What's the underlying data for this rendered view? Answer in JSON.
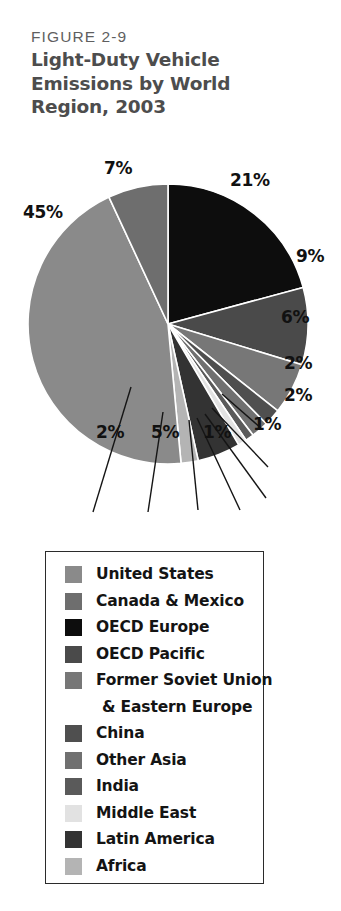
{
  "figure": {
    "number": "FIGURE 2-9",
    "title": "Light-Duty Vehicle Emissions by World Region, 2003"
  },
  "chart_data": {
    "type": "pie",
    "title": "Light-Duty Vehicle Emissions by World Region, 2003",
    "xlabel": "",
    "ylabel": "",
    "units": "percent of world light-duty vehicle emissions",
    "legend_position": "below",
    "grid": false,
    "categories": [
      "United States",
      "Canada & Mexico",
      "OECD Europe",
      "OECD Pacific",
      "Former Soviet Union & Eastern Europe",
      "China",
      "Other Asia",
      "India",
      "Middle East",
      "Latin America",
      "Africa"
    ],
    "values": [
      45,
      7,
      21,
      9,
      6,
      2,
      2,
      1,
      1,
      5,
      2
    ],
    "value_labels": [
      "45%",
      "7%",
      "21%",
      "9%",
      "6%",
      "2%",
      "2%",
      "1%",
      "1%",
      "5%",
      "2%"
    ],
    "colors": [
      "#8a8a8a",
      "#6e6e6e",
      "#0d0d0d",
      "#4a4a4a",
      "#777777",
      "#4f4f4f",
      "#707070",
      "#5a5a5a",
      "#e2e2e2",
      "#333333",
      "#b4b4b4"
    ],
    "slice_order_clockwise_from_12": [
      "OECD Europe",
      "OECD Pacific",
      "Former Soviet Union & Eastern Europe",
      "China",
      "Other Asia",
      "India",
      "Middle East",
      "Latin America",
      "Africa",
      "United States",
      "Canada & Mexico"
    ]
  },
  "labels": {
    "pct_21": "21%",
    "pct_9": "9%",
    "pct_6": "6%",
    "pct_2_china": "2%",
    "pct_2_otherasia": "2%",
    "pct_1_india": "1%",
    "pct_1_middleeast": "1%",
    "pct_5_latin": "5%",
    "pct_2_africa": "2%",
    "pct_45": "45%",
    "pct_7": "7%"
  },
  "legend": {
    "items": [
      {
        "label": "United States",
        "color": "#8a8a8a",
        "continuation": false
      },
      {
        "label": "Canada & Mexico",
        "color": "#6e6e6e",
        "continuation": false
      },
      {
        "label": "OECD Europe",
        "color": "#0d0d0d",
        "continuation": false
      },
      {
        "label": "OECD Pacific",
        "color": "#4a4a4a",
        "continuation": false
      },
      {
        "label": "Former Soviet Union",
        "color": "#777777",
        "continuation": false
      },
      {
        "label": "& Eastern Europe",
        "color": "#777777",
        "continuation": true
      },
      {
        "label": "China",
        "color": "#4f4f4f",
        "continuation": false
      },
      {
        "label": "Other Asia",
        "color": "#707070",
        "continuation": false
      },
      {
        "label": "India",
        "color": "#5a5a5a",
        "continuation": false
      },
      {
        "label": "Middle East",
        "color": "#e2e2e2",
        "continuation": false
      },
      {
        "label": "Latin America",
        "color": "#333333",
        "continuation": false
      },
      {
        "label": "Africa",
        "color": "#b4b4b4",
        "continuation": false
      }
    ]
  }
}
